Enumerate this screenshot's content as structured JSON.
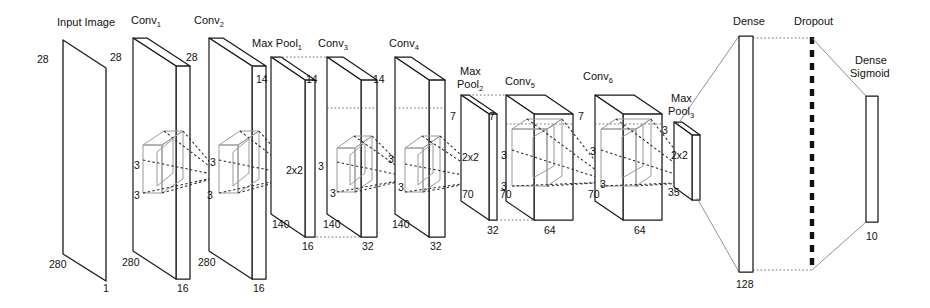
{
  "diagram": {
    "background": "#ffffff",
    "line_color": "#1a1a1a",
    "kernel_color": "#9a9a9a"
  },
  "layers": [
    {
      "id": "input",
      "label": "Input Image",
      "sub": "",
      "height": "28",
      "width": "280",
      "depth": "1",
      "kernel": null,
      "type": "plane"
    },
    {
      "id": "conv1",
      "label": "Conv",
      "sub": "1",
      "height": "28",
      "width": "280",
      "depth": "16",
      "kernel": {
        "h": "3",
        "w": "3"
      },
      "type": "slab"
    },
    {
      "id": "conv2",
      "label": "Conv",
      "sub": "2",
      "height": "28",
      "width": "280",
      "depth": "16",
      "kernel": {
        "h": "3",
        "w": "3"
      },
      "type": "slab"
    },
    {
      "id": "maxpool1",
      "label": "Max Pool",
      "sub": "1",
      "height": "14",
      "width": "140",
      "depth": "16",
      "kernel": {
        "h": "2x2",
        "w": ""
      },
      "type": "slab"
    },
    {
      "id": "conv3",
      "label": "Conv",
      "sub": "3",
      "height": "14",
      "width": "140",
      "depth": "32",
      "kernel": {
        "h": "3",
        "w": "3"
      },
      "type": "slab"
    },
    {
      "id": "conv4",
      "label": "Conv",
      "sub": "4",
      "height": "14",
      "width": "140",
      "depth": "32",
      "kernel": {
        "h": "3",
        "w": "3"
      },
      "type": "slab"
    },
    {
      "id": "maxpool2",
      "label": "Max\nPool",
      "sub": "2",
      "height": "7",
      "width": "70",
      "depth": "32",
      "kernel": {
        "h": "2x2",
        "w": ""
      },
      "type": "slab"
    },
    {
      "id": "conv5",
      "label": "Conv",
      "sub": "5",
      "height": "7",
      "width": "70",
      "depth": "64",
      "kernel": {
        "h": "3",
        "w": "3"
      },
      "type": "box"
    },
    {
      "id": "conv6",
      "label": "Conv",
      "sub": "6",
      "height": "7",
      "width": "70",
      "depth": "64",
      "kernel": {
        "h": "3",
        "w": "3"
      },
      "type": "box"
    },
    {
      "id": "maxpool3",
      "label": "Max\nPool",
      "sub": "3",
      "height": "3",
      "width": "35",
      "depth": "",
      "kernel": {
        "h": "2x2",
        "w": ""
      },
      "type": "slab"
    },
    {
      "id": "dense",
      "label": "Dense",
      "sub": "",
      "height": "",
      "width": "",
      "depth": "128",
      "kernel": null,
      "type": "bar"
    },
    {
      "id": "dropout",
      "label": "Dropout",
      "sub": "",
      "height": "",
      "width": "",
      "depth": "",
      "kernel": null,
      "type": "dashed"
    },
    {
      "id": "sigmoid",
      "label": "Dense\nSigmoid",
      "sub": "",
      "height": "",
      "width": "",
      "depth": "10",
      "kernel": null,
      "type": "bar"
    }
  ],
  "text": {
    "input_image": "Input Image",
    "conv": "Conv",
    "max_pool": "Max Pool",
    "max": "Max",
    "pool": "Pool",
    "dense": "Dense",
    "dropout": "Dropout",
    "dense_sigmoid_1": "Dense",
    "dense_sigmoid_2": "Sigmoid",
    "s1": "1",
    "s2": "2",
    "s3": "3",
    "s4": "4",
    "s5": "5",
    "s6": "6",
    "n28": "28",
    "n280": "280",
    "n1": "1",
    "n16": "16",
    "n3": "3",
    "n14": "14",
    "n140": "140",
    "n2x2": "2x2",
    "n32": "32",
    "n7": "7",
    "n70": "70",
    "n64": "64",
    "n35": "35",
    "n128": "128",
    "n10": "10"
  }
}
